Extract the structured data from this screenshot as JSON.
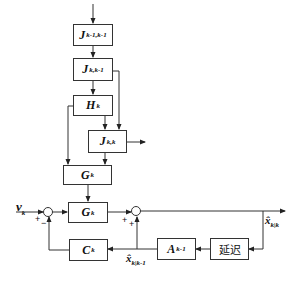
{
  "diagram": {
    "blocks": {
      "j_prev": {
        "main": "J",
        "sub": "k-1,k-1"
      },
      "j_pred": {
        "main": "J",
        "sub": "k,k-1"
      },
      "h": {
        "main": "H",
        "sub": "k"
      },
      "j_upd": {
        "main": "J",
        "sub": "k,k"
      },
      "g_upper": {
        "main": "G",
        "sub": "k"
      },
      "g_lower": {
        "main": "G",
        "sub": "k"
      },
      "c": {
        "main": "C",
        "sub": "k"
      },
      "a": {
        "main": "A",
        "sub": "k-1"
      },
      "delay": {
        "label": "延迟"
      }
    },
    "signals": {
      "input": {
        "main": "v",
        "sub": "k"
      },
      "output": {
        "main": "x̂",
        "sub": "k|k"
      },
      "prediction": {
        "main": "x̂",
        "sub": "k|k-1"
      }
    },
    "signs": {
      "sum1_left": "+",
      "sum1_bottom": "−",
      "sum2_left": "+",
      "sum2_bottom": "+"
    },
    "colors": {
      "line": "#333333",
      "text": "#111111",
      "background": "#ffffff"
    }
  }
}
